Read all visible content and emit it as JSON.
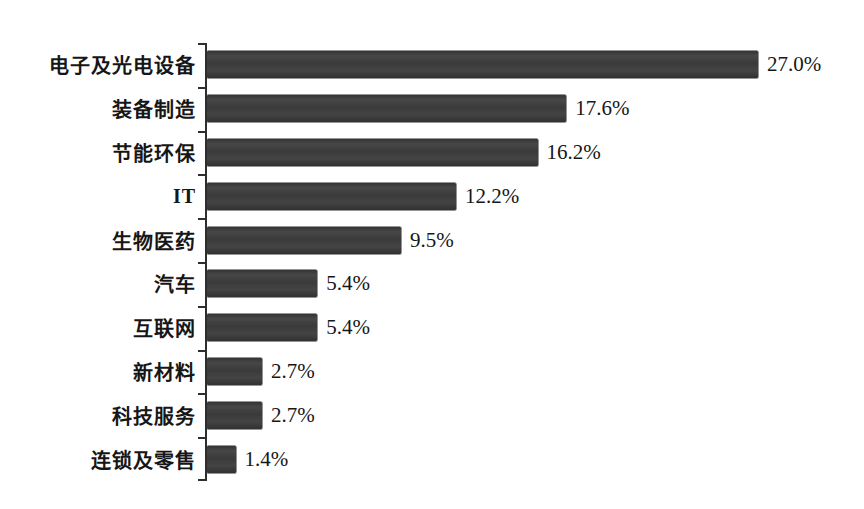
{
  "chart_data": {
    "type": "bar",
    "orientation": "horizontal",
    "title": "",
    "xlabel": "",
    "ylabel": "",
    "grid": false,
    "legend": false,
    "categories": [
      "电子及光电设备",
      "装备制造",
      "节能环保",
      "IT",
      "生物医药",
      "汽车",
      "互联网",
      "新材料",
      "科技服务",
      "连锁及零售"
    ],
    "values": [
      27.0,
      17.6,
      16.2,
      12.2,
      9.5,
      5.4,
      5.4,
      2.7,
      2.7,
      1.4
    ],
    "value_labels": [
      "27.0%",
      "17.6%",
      "16.2%",
      "12.2%",
      "9.5%",
      "5.4%",
      "5.4%",
      "2.7%",
      "2.7%",
      "1.4%"
    ],
    "xlim": [
      0,
      28.5
    ],
    "bar_color": "#3d3d3d",
    "axis_color": "#2e2e2e",
    "text_color": "#161616",
    "background_color": "#ffffff"
  }
}
